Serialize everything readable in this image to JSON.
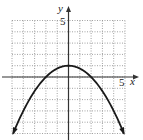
{
  "chart_data": {
    "type": "line",
    "title": "",
    "xlabel": "x",
    "ylabel": "y",
    "xlim": [
      -5,
      5
    ],
    "ylim": [
      -5,
      5
    ],
    "grid": true,
    "grid_style": "dotted",
    "tick_labels": {
      "x": [
        "5"
      ],
      "y": [
        "5"
      ]
    },
    "series": [
      {
        "name": "y = 1 - x^2/4",
        "equation": "y = -0.25x^2 + 1",
        "vertex": [
          0,
          1
        ],
        "x_intercepts": [
          -2,
          2
        ],
        "x": [
          -4.9,
          -4,
          -3,
          -2,
          -1,
          0,
          1,
          2,
          3,
          4,
          4.9
        ],
        "values": [
          -5.0,
          -3.0,
          -1.25,
          0,
          0.75,
          1,
          0.75,
          0,
          -1.25,
          -3.0,
          -5.0
        ],
        "arrows_both_ends": true
      }
    ]
  },
  "labels": {
    "x_axis": "x",
    "y_axis": "y",
    "x_tick": "5",
    "y_tick": "5"
  },
  "colors": {
    "curve": "#1a1a1a",
    "axis": "#333333",
    "grid": "#8a8a8a"
  }
}
